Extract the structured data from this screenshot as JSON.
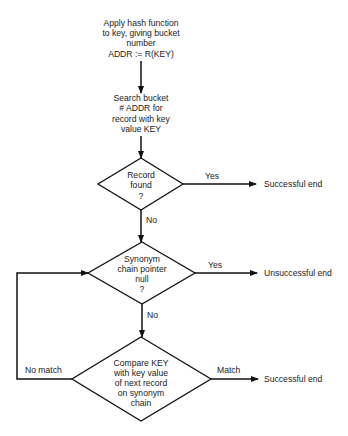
{
  "diagram": {
    "type": "flowchart",
    "steps": {
      "hash": {
        "lines": [
          "Apply hash function",
          "to key, giving bucket",
          "number",
          "ADDR := R(KEY)"
        ]
      },
      "search": {
        "lines": [
          "Search bucket",
          "# ADDR for",
          "record with key",
          "value KEY"
        ]
      }
    },
    "decisions": {
      "found": {
        "lines": [
          "Record",
          "found",
          "?"
        ],
        "yes_label": "Yes",
        "no_label": "No"
      },
      "null": {
        "lines": [
          "Synonym",
          "chain pointer",
          "null",
          "?"
        ],
        "yes_label": "Yes",
        "no_label": "No"
      },
      "compare": {
        "lines": [
          "Compare KEY",
          "with key value",
          "of next record",
          "on synonym",
          "chain"
        ],
        "match_label": "Match",
        "nomatch_label": "No match"
      }
    },
    "terminals": {
      "end1": "Successful end",
      "end2": "Unsuccessful end",
      "end3": "Successful end"
    }
  }
}
